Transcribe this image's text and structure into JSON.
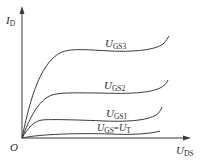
{
  "diagram": {
    "colors": {
      "line": "#3a3a3a",
      "text": "#2a2a2a",
      "background": "#ffffff"
    },
    "origin_label": "O",
    "y_axis": {
      "main": "I",
      "sub": "D"
    },
    "x_axis": {
      "main": "U",
      "sub": "DS"
    },
    "curves": [
      {
        "id": "ugs3",
        "main": "U",
        "sub": "GS3",
        "eq": "",
        "rhs_main": "",
        "rhs_sub": ""
      },
      {
        "id": "ugs2",
        "main": "U",
        "sub": "GS2",
        "eq": "",
        "rhs_main": "",
        "rhs_sub": ""
      },
      {
        "id": "ugs1",
        "main": "U",
        "sub": "GS1",
        "eq": "",
        "rhs_main": "",
        "rhs_sub": ""
      },
      {
        "id": "ugst",
        "main": "U",
        "sub": "GS",
        "eq": "=",
        "rhs_main": "U",
        "rhs_sub": "T"
      }
    ]
  }
}
